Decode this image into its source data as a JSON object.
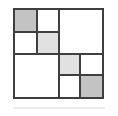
{
  "figure": {
    "background": "#ffffff",
    "outer": {
      "x": 13,
      "y": 8,
      "size": 91
    },
    "line_color": "#3f3f3f",
    "line_width": 2,
    "colors": {
      "medium_gray": "#c3c3c3",
      "light_gray": "#e1e1e1",
      "white": "#ffffff"
    },
    "grid_divisions": 4,
    "cells": [
      {
        "name": "top-left-quadrant-cell-tl",
        "col": 0,
        "row": 0,
        "colspan": 1,
        "rowspan": 1,
        "fill": "medium_gray"
      },
      {
        "name": "top-left-quadrant-cell-tr",
        "col": 1,
        "row": 0,
        "colspan": 1,
        "rowspan": 1,
        "fill": "white"
      },
      {
        "name": "top-left-quadrant-cell-bl",
        "col": 0,
        "row": 1,
        "colspan": 1,
        "rowspan": 1,
        "fill": "white"
      },
      {
        "name": "top-left-quadrant-cell-br",
        "col": 1,
        "row": 1,
        "colspan": 1,
        "rowspan": 1,
        "fill": "light_gray"
      },
      {
        "name": "top-right-quadrant",
        "col": 2,
        "row": 0,
        "colspan": 2,
        "rowspan": 2,
        "fill": "white"
      },
      {
        "name": "bottom-left-quadrant",
        "col": 0,
        "row": 2,
        "colspan": 2,
        "rowspan": 2,
        "fill": "white"
      },
      {
        "name": "bottom-right-quadrant-cell-tl",
        "col": 2,
        "row": 2,
        "colspan": 1,
        "rowspan": 1,
        "fill": "light_gray"
      },
      {
        "name": "bottom-right-quadrant-cell-tr",
        "col": 3,
        "row": 2,
        "colspan": 1,
        "rowspan": 1,
        "fill": "white"
      },
      {
        "name": "bottom-right-quadrant-cell-bl",
        "col": 2,
        "row": 3,
        "colspan": 1,
        "rowspan": 1,
        "fill": "white"
      },
      {
        "name": "bottom-right-quadrant-cell-br",
        "col": 3,
        "row": 3,
        "colspan": 1,
        "rowspan": 1,
        "fill": "medium_gray"
      }
    ],
    "lines": [
      {
        "name": "mid-vertical-line",
        "orient": "v",
        "pos": 0.5,
        "from": 0,
        "to": 1
      },
      {
        "name": "mid-horizontal-line",
        "orient": "h",
        "pos": 0.5,
        "from": 0,
        "to": 1
      },
      {
        "name": "top-left-sub-vertical-line",
        "orient": "v",
        "pos": 0.25,
        "from": 0,
        "to": 0.5
      },
      {
        "name": "top-left-sub-horizontal-line",
        "orient": "h",
        "pos": 0.25,
        "from": 0,
        "to": 0.5
      },
      {
        "name": "bottom-right-sub-vertical-line",
        "orient": "v",
        "pos": 0.75,
        "from": 0.5,
        "to": 1
      },
      {
        "name": "bottom-right-sub-horizontal-line",
        "orient": "h",
        "pos": 0.75,
        "from": 0.5,
        "to": 1
      }
    ],
    "shadow": {
      "x": 13,
      "y": 107,
      "width": 92,
      "height": 2,
      "color": "#e9e9e9"
    }
  }
}
